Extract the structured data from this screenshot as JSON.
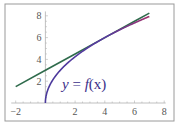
{
  "chart_data": {
    "type": "line",
    "title": "",
    "xlabel": "",
    "ylabel": "",
    "xlim": [
      -2,
      8
    ],
    "ylim": [
      0,
      8
    ],
    "x_ticks": [
      "-2",
      "2",
      "4",
      "6",
      "8"
    ],
    "y_ticks": [
      "2",
      "4",
      "6",
      "8"
    ],
    "grid": false,
    "legend": "none",
    "annotations": [
      {
        "text": "y = f(x)",
        "x": 2.7,
        "y": 2.2
      }
    ],
    "series": [
      {
        "name": "f(x) = 3√x",
        "color": "#4b3a9c",
        "x": [
          0,
          0.1,
          0.25,
          0.5,
          1,
          1.5,
          2,
          3,
          4,
          5,
          6,
          7
        ],
        "values": [
          0,
          0.95,
          1.5,
          2.12,
          3,
          3.67,
          4.24,
          5.2,
          6,
          6.71,
          7.35,
          7.94
        ]
      },
      {
        "name": "tangent line at x=4",
        "color": "#2f6b4c",
        "x": [
          -2,
          0,
          2,
          4,
          6,
          7
        ],
        "values": [
          1.5,
          3,
          4.5,
          6,
          7.5,
          8.25
        ]
      }
    ]
  },
  "labels": {
    "curve_label_y": "y",
    "curve_label_eq": " = ",
    "curve_label_f": "f",
    "curve_label_x": "(x)"
  }
}
